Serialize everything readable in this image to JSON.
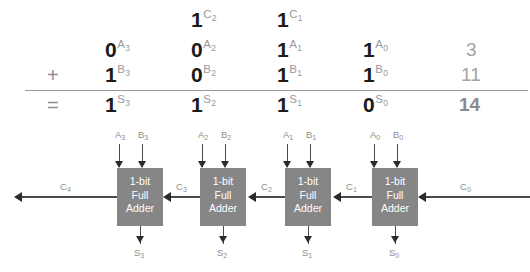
{
  "arithmetic": {
    "operator_plus": "+",
    "operator_equals": "=",
    "rows": {
      "carry": {
        "name": "carry",
        "bits": [
          {
            "value": "",
            "label": "",
            "sub": ""
          },
          {
            "value": "1",
            "label": "C",
            "sub": "2"
          },
          {
            "value": "1",
            "label": "C",
            "sub": "1"
          },
          {
            "value": "",
            "label": "",
            "sub": ""
          }
        ],
        "decimal": ""
      },
      "a": {
        "name": "A",
        "bits": [
          {
            "value": "0",
            "label": "A",
            "sub": "3"
          },
          {
            "value": "0",
            "label": "A",
            "sub": "2"
          },
          {
            "value": "1",
            "label": "A",
            "sub": "1"
          },
          {
            "value": "1",
            "label": "A",
            "sub": "0"
          }
        ],
        "decimal": "3"
      },
      "b": {
        "name": "B",
        "bits": [
          {
            "value": "1",
            "label": "B",
            "sub": "3"
          },
          {
            "value": "0",
            "label": "B",
            "sub": "2"
          },
          {
            "value": "1",
            "label": "B",
            "sub": "1"
          },
          {
            "value": "1",
            "label": "B",
            "sub": "0"
          }
        ],
        "decimal": "11"
      },
      "sum": {
        "name": "S",
        "bits": [
          {
            "value": "1",
            "label": "S",
            "sub": "3"
          },
          {
            "value": "1",
            "label": "S",
            "sub": "2"
          },
          {
            "value": "1",
            "label": "S",
            "sub": "1"
          },
          {
            "value": "0",
            "label": "S",
            "sub": "0"
          }
        ],
        "decimal": "14"
      }
    }
  },
  "diagram": {
    "box_lines": [
      "1-bit",
      "Full",
      "Adder"
    ],
    "adders": [
      {
        "index": 3,
        "a_label": "A",
        "a_sub": "3",
        "b_label": "B",
        "b_sub": "3",
        "sum_label": "S",
        "sum_sub": "3",
        "carry_out_label": "C",
        "carry_out_sub": "4",
        "carry_in_label": "C",
        "carry_in_sub": "3"
      },
      {
        "index": 2,
        "a_label": "A",
        "a_sub": "2",
        "b_label": "B",
        "b_sub": "2",
        "sum_label": "S",
        "sum_sub": "2",
        "carry_out_label": "C",
        "carry_out_sub": "3",
        "carry_in_label": "C",
        "carry_in_sub": "2"
      },
      {
        "index": 1,
        "a_label": "A",
        "a_sub": "1",
        "b_label": "B",
        "b_sub": "1",
        "sum_label": "S",
        "sum_sub": "1",
        "carry_out_label": "C",
        "carry_out_sub": "2",
        "carry_in_label": "C",
        "carry_in_sub": "1"
      },
      {
        "index": 0,
        "a_label": "A",
        "a_sub": "0",
        "b_label": "B",
        "b_sub": "0",
        "sum_label": "S",
        "sum_sub": "0",
        "carry_out_label": "C",
        "carry_out_sub": "1",
        "carry_in_label": "C",
        "carry_in_sub": "0"
      }
    ]
  },
  "colors": {
    "box_fill": "#868686",
    "box_text": "#ffffff",
    "signal_label": "#8e8e8e",
    "wire": "#4a4a4a",
    "bit_digit": "#1b1b1b",
    "bit_superscript": "#9a9a9a",
    "decimal": "#a3a3a3",
    "rule": "#9b9b9b",
    "background": "#ffffff"
  }
}
